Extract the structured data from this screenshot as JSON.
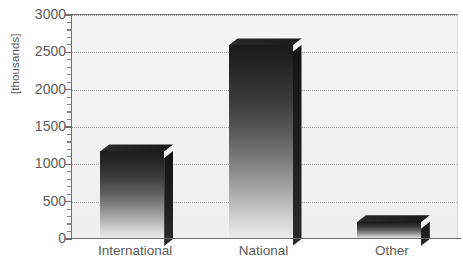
{
  "chart_data": {
    "type": "bar",
    "title": "",
    "subtitle": "",
    "xlabel": "",
    "ylabel": "[thousands]",
    "categories": [
      "International",
      "National",
      "Other"
    ],
    "values": [
      1180,
      2600,
      230
    ],
    "series": [
      {
        "name": "",
        "values": [
          1180,
          2600,
          230
        ]
      }
    ],
    "ylim": [
      0,
      3000
    ],
    "y_ticks": [
      0,
      500,
      1000,
      1500,
      2000,
      2500,
      3000
    ],
    "y_tick_labels": [
      "0",
      "500",
      "1000",
      "1500",
      "2000",
      "2500",
      "3000"
    ],
    "y_minor_tick_interval": 100,
    "grid": {
      "horizontal": true,
      "vertical": false,
      "style": "dotted",
      "color": "#9a9a9c"
    },
    "legend": {
      "visible": false,
      "position": "none",
      "entries": []
    },
    "annotations": [],
    "style": {
      "bar_style": "3d-block",
      "bar_fill": "grayscale-vertical-gradient",
      "bar_top_color": "#1a1a1a",
      "bar_bottom_color": "#ebebeb",
      "bar_side_color": "#1d1d1d",
      "plot_background": "#f2f2f2",
      "axis_color": "#6e6e70",
      "text_color": "#5b5b5d",
      "page_background": "#ffffff"
    }
  },
  "axes": {
    "y_title": "[thousands]"
  }
}
